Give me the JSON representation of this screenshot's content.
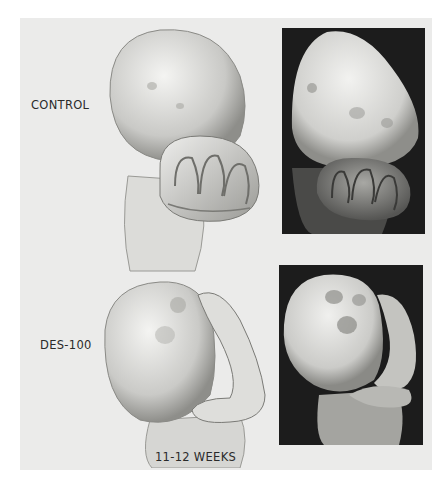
{
  "figure": {
    "rows": [
      {
        "label": "CONTROL",
        "drawing": "illustration of control embryo brain and folded structure",
        "micrograph": "scanning electron micrograph, control"
      },
      {
        "label": "DES-100",
        "drawing": "illustration of DES-100 treated embryo",
        "micrograph": "scanning electron micrograph, DES-100"
      }
    ],
    "age_label": "11-12 WEEKS"
  },
  "colors": {
    "panel_background": "#ebebea",
    "micrograph_background": "#1c1c1c",
    "label_text": "#2a2a2a"
  }
}
